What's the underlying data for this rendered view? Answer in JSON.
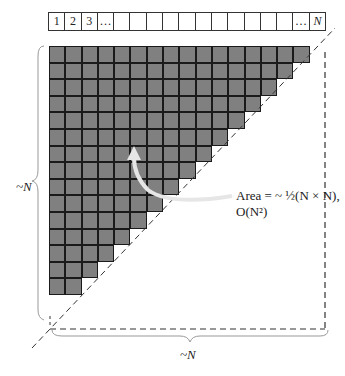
{
  "top_bar": {
    "cells": [
      "1",
      "2",
      "3",
      "…",
      "",
      "",
      "",
      "",
      "",
      "",
      "",
      "",
      "",
      "",
      "",
      "…",
      "N"
    ]
  },
  "grid": {
    "row_counts": [
      16,
      15,
      14,
      13,
      12,
      11,
      10,
      9,
      8,
      7,
      6,
      5,
      4,
      3,
      2
    ],
    "fill_color": "#808080",
    "line_color": "#1a1a1a"
  },
  "annotation": {
    "line1": "Area = ~ ½(N × N),",
    "line2": "O(N²)"
  },
  "left_label": "~N",
  "bottom_label": "~N"
}
